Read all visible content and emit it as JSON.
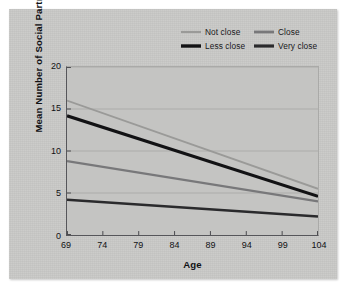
{
  "figure": {
    "card_color": "#c9c9c7",
    "plot_background": "#c4c4c2"
  },
  "legend": {
    "entries": [
      {
        "label": "Not close",
        "color": "#9a9a98",
        "thickness": 2.0
      },
      {
        "label": "Close",
        "color": "#78787a",
        "thickness": 2.4
      },
      {
        "label": "Less close",
        "color": "#121214",
        "thickness": 3.0
      },
      {
        "label": "Very close",
        "color": "#2a2a2c",
        "thickness": 2.8
      }
    ]
  },
  "chart_data": {
    "type": "line",
    "title": "",
    "subtitle": "",
    "xlabel": "Age",
    "ylabel": "Mean Number of Social Partners",
    "x": [
      69,
      104
    ],
    "xlim": [
      69,
      104
    ],
    "ylim": [
      0,
      20
    ],
    "xticks": [
      69,
      74,
      79,
      84,
      89,
      94,
      99,
      104
    ],
    "yticks": [
      0,
      5,
      10,
      15,
      20
    ],
    "xtick_labels": [
      "69",
      "74",
      "79",
      "84",
      "89",
      "94",
      "99",
      "104"
    ],
    "ytick_labels": [
      "0",
      "5",
      "10",
      "15",
      "20"
    ],
    "grid": "horizontal",
    "legend_position": "top-right",
    "series": [
      {
        "name": "Not close",
        "color": "#9a9a98",
        "width": 1.8,
        "values": [
          16.0,
          5.5
        ],
        "points": [
          {
            "x": 69,
            "y": 16.0
          },
          {
            "x": 104,
            "y": 5.5
          }
        ]
      },
      {
        "name": "Less close",
        "color": "#121214",
        "width": 3.2,
        "values": [
          14.2,
          4.6
        ],
        "points": [
          {
            "x": 69,
            "y": 14.2
          },
          {
            "x": 104,
            "y": 4.6
          }
        ]
      },
      {
        "name": "Close",
        "color": "#78787a",
        "width": 2.2,
        "values": [
          8.8,
          4.0
        ],
        "points": [
          {
            "x": 69,
            "y": 8.8
          },
          {
            "x": 104,
            "y": 4.0
          }
        ]
      },
      {
        "name": "Very close",
        "color": "#2a2a2c",
        "width": 2.6,
        "values": [
          4.2,
          2.2
        ],
        "points": [
          {
            "x": 69,
            "y": 4.2
          },
          {
            "x": 104,
            "y": 2.2
          }
        ]
      }
    ]
  }
}
